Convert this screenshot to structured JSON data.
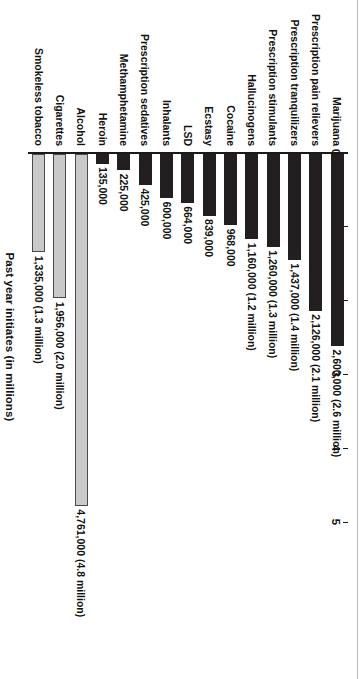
{
  "chart_data": {
    "type": "bar",
    "orientation": "horizontal",
    "title": "",
    "xlabel": "Past year initiates (in millions)",
    "ylabel": "",
    "xlim": [
      0,
      5
    ],
    "xticks": [
      "0",
      "1",
      "2",
      "3",
      "4",
      "5"
    ],
    "grid": false,
    "legend": null,
    "categories": [
      "Marijuana",
      "Prescription pain relievers",
      "Prescription tranquilizers",
      "Prescription stimulants",
      "Hallucinogens",
      "Cocaine",
      "Ecstasy",
      "LSD",
      "Inhalants",
      "Prescription sedatives",
      "Methamphetamine",
      "Heroin",
      "Alcohol",
      "Cigarettes",
      "Smokeless tobacco"
    ],
    "values": [
      2600000,
      2126000,
      1437000,
      1260000,
      1160000,
      968000,
      839000,
      664000,
      600000,
      425000,
      225000,
      135000,
      4761000,
      1956000,
      1335000
    ],
    "data_labels": [
      "2,600,000 (2.6 million)",
      "2,126,000 (2.1 million)",
      "1,437,000 (1.4 million)",
      "1,260,000 (1.3 million)",
      "1,160,000 (1.2 million)",
      "968,000",
      "839,000",
      "664,000",
      "600,000",
      "425,000",
      "225,000",
      "135,000",
      "4,761,000 (4.8 million)",
      "1,956,000 (2.0 million)",
      "1,335,000 (1.3 million)"
    ],
    "bar_styles": [
      "dark",
      "dark",
      "dark",
      "dark",
      "dark",
      "dark",
      "dark",
      "dark",
      "dark",
      "dark",
      "dark",
      "dark",
      "light",
      "light",
      "light"
    ],
    "colors": {
      "dark_bar": "#231f20",
      "light_bar": "#c9c9c9",
      "light_bar_outline": "#4a4a4a",
      "axis": "#1a1a1a",
      "text": "#111111",
      "background": "#ffffff"
    }
  }
}
